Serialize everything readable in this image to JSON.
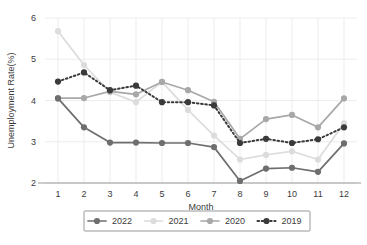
{
  "chart_data": {
    "type": "line",
    "title": "",
    "xlabel": "Month",
    "ylabel": "Unemployment Rate(%)",
    "categories": [
      "1",
      "2",
      "3",
      "4",
      "5",
      "6",
      "7",
      "8",
      "9",
      "10",
      "11",
      "12"
    ],
    "x": [
      1,
      2,
      3,
      4,
      5,
      6,
      7,
      8,
      9,
      10,
      11,
      12
    ],
    "xlim": [
      0.5,
      12.5
    ],
    "ylim": [
      2,
      6
    ],
    "yticks": [
      2,
      3,
      4,
      5,
      6
    ],
    "ytick_labels": [
      "2",
      "3",
      "4",
      "5",
      "6"
    ],
    "xtick_labels": [
      "1",
      "2",
      "3",
      "4",
      "5",
      "6",
      "7",
      "8",
      "9",
      "10",
      "11",
      "12"
    ],
    "grid": true,
    "grid_axis": "both",
    "legend_position": "bottom",
    "legend_entries": [
      "2022",
      "2021",
      "2020",
      "2019"
    ],
    "series": [
      {
        "name": "2022",
        "color": "#6e6e6e",
        "linestyle": "solid",
        "marker": "circle",
        "values": [
          4.05,
          3.35,
          2.98,
          2.98,
          2.97,
          2.97,
          2.87,
          2.05,
          2.35,
          2.37,
          2.27,
          2.96
        ]
      },
      {
        "name": "2021",
        "color": "#dcdcdc",
        "linestyle": "solid",
        "marker": "circle",
        "values": [
          5.68,
          4.86,
          4.2,
          3.96,
          4.45,
          3.77,
          3.15,
          2.57,
          2.68,
          2.77,
          2.57,
          3.45
        ]
      },
      {
        "name": "2020",
        "color": "#a8a8a8",
        "linestyle": "solid",
        "marker": "circle",
        "values": [
          4.06,
          4.06,
          4.22,
          4.15,
          4.45,
          4.25,
          3.97,
          3.07,
          3.55,
          3.65,
          3.35,
          4.05
        ]
      },
      {
        "name": "2019",
        "color": "#3a3a3a",
        "linestyle": "dotted",
        "marker": "circle",
        "values": [
          4.46,
          4.68,
          4.25,
          4.36,
          3.96,
          3.96,
          3.88,
          2.97,
          3.07,
          2.97,
          3.06,
          3.35
        ]
      }
    ]
  },
  "axes": {
    "y_axis_label": "Unemployment Rate(%)",
    "x_axis_label": "Month"
  },
  "colors": {
    "grid": "#e9e9e9",
    "axis": "#9a9a9a",
    "text": "#3b3b3b",
    "legend_border": "#8c8c8c",
    "background": "#ffffff"
  }
}
